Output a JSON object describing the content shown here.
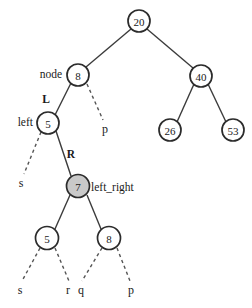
{
  "diagram": {
    "type": "binary-tree",
    "colors": {
      "node_stroke": "#2b2b2b",
      "node_fill": "#ffffff",
      "highlight_fill": "#c9c9c9",
      "edge_solid": "#3b3b3b",
      "edge_dashed": "#555555",
      "text": "#1a1a1a",
      "background": "#ffffff"
    },
    "nodes": [
      {
        "id": "n20",
        "label": "20",
        "cx": 139,
        "cy": 21,
        "r": 11,
        "fill": "white"
      },
      {
        "id": "n8",
        "label": "8",
        "cx": 78,
        "cy": 75,
        "r": 11,
        "fill": "white"
      },
      {
        "id": "n40",
        "label": "40",
        "cx": 201,
        "cy": 76,
        "r": 11,
        "fill": "white"
      },
      {
        "id": "n26",
        "label": "26",
        "cx": 170,
        "cy": 130,
        "r": 11,
        "fill": "white"
      },
      {
        "id": "n53",
        "label": "53",
        "cx": 233,
        "cy": 130,
        "r": 11,
        "fill": "white"
      },
      {
        "id": "n5a",
        "label": "5",
        "cx": 48,
        "cy": 123,
        "r": 11,
        "fill": "white"
      },
      {
        "id": "n7",
        "label": "7",
        "cx": 78,
        "cy": 186,
        "r": 11.5,
        "fill": "gray"
      },
      {
        "id": "n5b",
        "label": "5",
        "cx": 47,
        "cy": 238,
        "r": 11.5,
        "fill": "white"
      },
      {
        "id": "n8b",
        "label": "8",
        "cx": 109,
        "cy": 238,
        "r": 11.5,
        "fill": "white"
      }
    ],
    "solid_edges": [
      {
        "from": "n20",
        "to": "n8",
        "x1": 131,
        "y1": 29,
        "x2": 86,
        "y2": 67
      },
      {
        "from": "n20",
        "to": "n40",
        "x1": 147,
        "y1": 29,
        "x2": 193,
        "y2": 68
      },
      {
        "from": "n40",
        "to": "n26",
        "x1": 194,
        "y1": 84,
        "x2": 177,
        "y2": 122
      },
      {
        "from": "n40",
        "to": "n53",
        "x1": 208,
        "y1": 84,
        "x2": 226,
        "y2": 122
      },
      {
        "from": "n8",
        "to": "n5a",
        "x1": 71,
        "y1": 83,
        "x2": 55,
        "y2": 115
      },
      {
        "from": "n5a",
        "to": "n7",
        "x1": 56,
        "y1": 131,
        "x2": 71,
        "y2": 176
      },
      {
        "from": "n7",
        "to": "n5b",
        "x1": 70,
        "y1": 195,
        "x2": 55,
        "y2": 229
      },
      {
        "from": "n7",
        "to": "n8b",
        "x1": 87,
        "y1": 195,
        "x2": 101,
        "y2": 229
      }
    ],
    "dashed_edges": [
      {
        "from": "n8",
        "to": "p-right",
        "x1": 87,
        "y1": 84,
        "x2": 103,
        "y2": 120
      },
      {
        "from": "n5a",
        "to": "s-left",
        "x1": 41,
        "y1": 132,
        "x2": 24,
        "y2": 174
      },
      {
        "from": "n5b",
        "to": "s-bottom",
        "x1": 40,
        "y1": 248,
        "x2": 22,
        "y2": 281
      },
      {
        "from": "n5b",
        "to": "r-bottom",
        "x1": 55,
        "y1": 248,
        "x2": 69,
        "y2": 281
      },
      {
        "from": "n8b",
        "to": "q-bottom",
        "x1": 102,
        "y1": 248,
        "x2": 82,
        "y2": 281
      },
      {
        "from": "n8b",
        "to": "p-bottom",
        "x1": 117,
        "y1": 248,
        "x2": 130,
        "y2": 281
      }
    ],
    "edge_labels": [
      {
        "id": "label-L",
        "text": "L",
        "x": 46,
        "y": 99
      },
      {
        "id": "label-R",
        "text": "R",
        "x": 71,
        "y": 154
      }
    ],
    "node_annotations": [
      {
        "id": "annot-node",
        "text": "node",
        "x": 62,
        "y": 74,
        "anchor": "end"
      },
      {
        "id": "annot-left",
        "text": "left",
        "x": 33,
        "y": 122,
        "anchor": "end"
      },
      {
        "id": "annot-left-right",
        "text": "left_right",
        "x": 91,
        "y": 187,
        "anchor": "start"
      }
    ],
    "leaf_labels": [
      {
        "id": "leaf-p-right",
        "text": "p",
        "x": 105,
        "y": 129
      },
      {
        "id": "leaf-s-left",
        "text": "s",
        "x": 21,
        "y": 183
      },
      {
        "id": "leaf-s-bottom",
        "text": "s",
        "x": 20,
        "y": 290
      },
      {
        "id": "leaf-r-bottom",
        "text": "r",
        "x": 68,
        "y": 290
      },
      {
        "id": "leaf-q-bottom",
        "text": "q",
        "x": 81,
        "y": 290
      },
      {
        "id": "leaf-p-bottom",
        "text": "p",
        "x": 131,
        "y": 290
      }
    ]
  }
}
